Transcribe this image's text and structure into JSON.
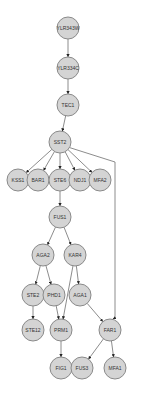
{
  "graph": {
    "type": "directed-network",
    "node_fill": "#d4d4d4",
    "node_stroke": "#8a8a8a",
    "edge_color": "#6e6e6e",
    "node_radius": 11,
    "nodes": [
      {
        "id": "YLR343W",
        "label": "YLR343W",
        "x": 68,
        "y": 28
      },
      {
        "id": "YLR334C",
        "label": "YLR334C",
        "x": 68,
        "y": 68
      },
      {
        "id": "TEC1",
        "label": "TEC1",
        "x": 68,
        "y": 105
      },
      {
        "id": "SST2",
        "label": "SST2",
        "x": 60,
        "y": 142
      },
      {
        "id": "KSS1",
        "label": "KSS1",
        "x": 18,
        "y": 180
      },
      {
        "id": "BAR1",
        "label": "BAR1",
        "x": 38,
        "y": 180
      },
      {
        "id": "STE6",
        "label": "STE6",
        "x": 60,
        "y": 180
      },
      {
        "id": "NDJ1",
        "label": "NDJ1",
        "x": 80,
        "y": 180
      },
      {
        "id": "MFA2",
        "label": "MFA2",
        "x": 100,
        "y": 180
      },
      {
        "id": "FUS1",
        "label": "FUS1",
        "x": 60,
        "y": 217
      },
      {
        "id": "AGA2",
        "label": "AGA2",
        "x": 43,
        "y": 255
      },
      {
        "id": "KAR4",
        "label": "KAR4",
        "x": 75,
        "y": 255
      },
      {
        "id": "STE2",
        "label": "STE2",
        "x": 33,
        "y": 295
      },
      {
        "id": "PHD1",
        "label": "PHD1",
        "x": 54,
        "y": 295
      },
      {
        "id": "AGA1",
        "label": "AGA1",
        "x": 80,
        "y": 295
      },
      {
        "id": "STE12",
        "label": "STE12",
        "x": 33,
        "y": 330
      },
      {
        "id": "PRM1",
        "label": "PRM1",
        "x": 61,
        "y": 330
      },
      {
        "id": "FAR1",
        "label": "FAR1",
        "x": 110,
        "y": 330
      },
      {
        "id": "FIG1",
        "label": "FIG1",
        "x": 61,
        "y": 368
      },
      {
        "id": "FUS3",
        "label": "FUS3",
        "x": 82,
        "y": 368
      },
      {
        "id": "MFA1",
        "label": "MFA1",
        "x": 115,
        "y": 368
      }
    ],
    "edges": [
      {
        "from": "YLR343W",
        "to": "YLR334C"
      },
      {
        "from": "YLR334C",
        "to": "TEC1"
      },
      {
        "from": "TEC1",
        "to": "SST2"
      },
      {
        "from": "SST2",
        "to": "KSS1"
      },
      {
        "from": "SST2",
        "to": "BAR1"
      },
      {
        "from": "SST2",
        "to": "STE6"
      },
      {
        "from": "SST2",
        "to": "NDJ1"
      },
      {
        "from": "SST2",
        "to": "MFA2"
      },
      {
        "from": "SST2",
        "to": "FAR1",
        "route": "elbow-right"
      },
      {
        "from": "STE6",
        "to": "FUS1"
      },
      {
        "from": "FUS1",
        "to": "AGA2"
      },
      {
        "from": "FUS1",
        "to": "KAR4"
      },
      {
        "from": "AGA2",
        "to": "STE2"
      },
      {
        "from": "AGA2",
        "to": "PHD1"
      },
      {
        "from": "KAR4",
        "to": "AGA1"
      },
      {
        "from": "KAR4",
        "to": "PRM1"
      },
      {
        "from": "STE2",
        "to": "STE12"
      },
      {
        "from": "PHD1",
        "to": "PRM1"
      },
      {
        "from": "AGA1",
        "to": "FAR1"
      },
      {
        "from": "PRM1",
        "to": "FIG1"
      },
      {
        "from": "FAR1",
        "to": "FUS3"
      },
      {
        "from": "FAR1",
        "to": "MFA1"
      }
    ]
  }
}
